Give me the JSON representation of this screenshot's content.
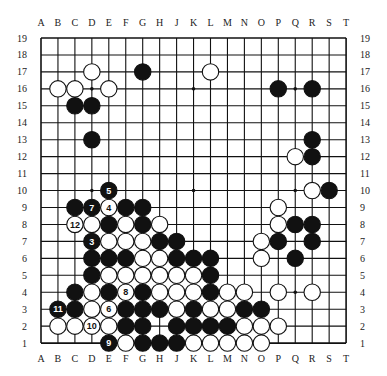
{
  "diagram": {
    "type": "go-board",
    "size": 19,
    "columns": [
      "A",
      "B",
      "C",
      "D",
      "E",
      "F",
      "G",
      "H",
      "J",
      "K",
      "L",
      "M",
      "N",
      "O",
      "P",
      "Q",
      "R",
      "S",
      "T"
    ],
    "rows": [
      19,
      18,
      17,
      16,
      15,
      14,
      13,
      12,
      11,
      10,
      9,
      8,
      7,
      6,
      5,
      4,
      3,
      2,
      1
    ],
    "star_points": [
      "D16",
      "K16",
      "Q16",
      "D10",
      "K10",
      "Q10",
      "D4",
      "K4",
      "Q4"
    ],
    "colors": {
      "black": "#111111",
      "white": "#ffffff",
      "line": "#111111"
    },
    "stones": {
      "black": [
        "G17",
        "C15",
        "D15",
        "D13",
        "P16",
        "R16",
        "R13",
        "R12",
        "S10",
        "C9",
        "F9",
        "G9",
        "E8",
        "G8",
        "Q8",
        "R8",
        "H7",
        "J7",
        "P7",
        "R7",
        "D6",
        "E6",
        "F6",
        "J6",
        "K6",
        "L6",
        "Q6",
        "D5",
        "L5",
        "C4",
        "E4",
        "G4",
        "L4",
        "C3",
        "F3",
        "G3",
        "H3",
        "K3",
        "N3",
        "O3",
        "F2",
        "G2",
        "J2",
        "K2",
        "L2",
        "M2",
        "G1",
        "H1",
        "J1"
      ],
      "white": [
        "D17",
        "L17",
        "B16",
        "C16",
        "E16",
        "Q12",
        "R10",
        "P9",
        "D8",
        "F8",
        "H8",
        "P8",
        "E7",
        "F7",
        "G7",
        "O7",
        "G6",
        "H6",
        "O6",
        "E5",
        "F5",
        "G5",
        "H5",
        "J5",
        "K5",
        "D4",
        "H4",
        "J4",
        "K4",
        "M4",
        "N4",
        "P4",
        "R4",
        "D3",
        "J3",
        "L3",
        "M3",
        "B2",
        "C2",
        "E2",
        "N2",
        "O2",
        "P2",
        "F1",
        "K1",
        "L1",
        "M1",
        "N1",
        "O1"
      ]
    },
    "numbered_moves": [
      {
        "n": "3",
        "color": "black",
        "point": "D7"
      },
      {
        "n": "4",
        "color": "white",
        "point": "E9"
      },
      {
        "n": "5",
        "color": "black",
        "point": "E10"
      },
      {
        "n": "6",
        "color": "white",
        "point": "E3"
      },
      {
        "n": "7",
        "color": "black",
        "point": "D9"
      },
      {
        "n": "8",
        "color": "white",
        "point": "F4"
      },
      {
        "n": "9",
        "color": "black",
        "point": "E1"
      },
      {
        "n": "10",
        "color": "white",
        "point": "D2"
      },
      {
        "n": "11",
        "color": "black",
        "point": "B3"
      },
      {
        "n": "12",
        "color": "white",
        "point": "C8"
      }
    ]
  }
}
